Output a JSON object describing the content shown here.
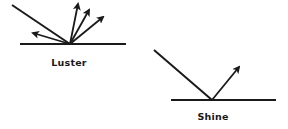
{
  "diagram": {
    "figures": [
      {
        "id": "luster",
        "label": "Luster",
        "surface": {
          "x1": 20,
          "y1": 44,
          "x2": 126,
          "y2": 44
        },
        "incident_ray": {
          "x1": 12,
          "y1": 5,
          "x2": 70,
          "y2": 44
        },
        "reflected_rays": [
          {
            "x1": 70,
            "y1": 44,
            "x2": 33,
            "y2": 33
          },
          {
            "x1": 70,
            "y1": 44,
            "x2": 78,
            "y2": 4
          },
          {
            "x1": 70,
            "y1": 44,
            "x2": 89,
            "y2": 10
          },
          {
            "x1": 70,
            "y1": 44,
            "x2": 103,
            "y2": 17
          }
        ],
        "label_pos": {
          "x": 69,
          "y": 57
        }
      },
      {
        "id": "shine",
        "label": "Shine",
        "surface": {
          "x1": 171,
          "y1": 100,
          "x2": 276,
          "y2": 100
        },
        "incident_ray": {
          "x1": 154,
          "y1": 50,
          "x2": 212,
          "y2": 100
        },
        "reflected_rays": [
          {
            "x1": 212,
            "y1": 100,
            "x2": 239,
            "y2": 67
          }
        ],
        "label_pos": {
          "x": 213,
          "y": 111
        }
      }
    ],
    "colors": {
      "ink": "#1a1a1a",
      "background": "#ffffff"
    }
  }
}
